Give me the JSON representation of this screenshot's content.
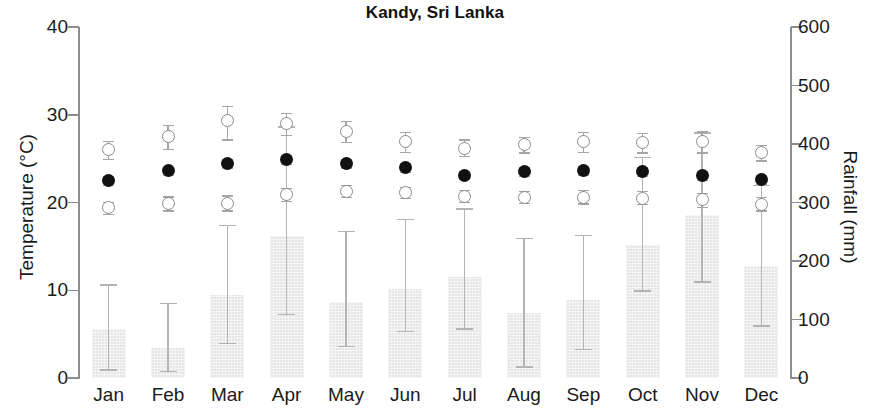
{
  "chart_data": {
    "type": "bar",
    "title": "Kandy, Sri Lanka",
    "xlabel": "",
    "ylabel": "Temperature (°C)",
    "y2label": "Rainfall (mm)",
    "categories": [
      "Jan",
      "Feb",
      "Mar",
      "Apr",
      "May",
      "Jun",
      "Jul",
      "Aug",
      "Sep",
      "Oct",
      "Nov",
      "Dec"
    ],
    "ylim": [
      0,
      40
    ],
    "yticks": [
      0,
      10,
      20,
      30,
      40
    ],
    "y2lim": [
      0,
      600
    ],
    "y2ticks": [
      0,
      100,
      200,
      300,
      400,
      500,
      600
    ],
    "grid": false,
    "legend": "none",
    "series": [
      {
        "name": "Rainfall",
        "axis": "right",
        "render": "bar",
        "unit": "mm",
        "values": [
          83,
          51,
          142,
          242,
          130,
          152,
          173,
          111,
          133,
          228,
          278,
          191
        ],
        "err_low": [
          15,
          12,
          60,
          110,
          55,
          80,
          85,
          20,
          50,
          150,
          165,
          90
        ],
        "err_high": [
          160,
          128,
          262,
          430,
          252,
          272,
          290,
          240,
          245,
          378,
          420,
          330
        ]
      },
      {
        "name": "Mean monthly maximum temperature",
        "axis": "left",
        "render": "open-circle",
        "unit": "°C",
        "values": [
          26.0,
          27.5,
          29.4,
          29.0,
          28.1,
          26.9,
          26.2,
          26.6,
          26.9,
          26.8,
          26.9,
          25.7
        ],
        "err_low": [
          25.0,
          26.1,
          27.2,
          27.7,
          26.9,
          25.8,
          25.3,
          25.7,
          25.8,
          25.7,
          25.7,
          24.8
        ],
        "err_high": [
          27.0,
          28.8,
          31.0,
          30.2,
          29.3,
          28.0,
          27.2,
          27.5,
          28.0,
          27.9,
          28.1,
          26.6
        ]
      },
      {
        "name": "Mean monthly temperature",
        "axis": "left",
        "render": "filled-circle",
        "unit": "°C",
        "values": [
          22.5,
          23.6,
          24.5,
          24.9,
          24.5,
          24.0,
          23.1,
          23.5,
          23.7,
          23.5,
          23.1,
          22.6
        ],
        "err_low": [
          22.0,
          23.1,
          24.0,
          24.4,
          24.0,
          23.5,
          22.7,
          23.0,
          23.2,
          23.0,
          22.6,
          22.1
        ],
        "err_high": [
          23.0,
          24.1,
          25.0,
          25.4,
          25.0,
          24.5,
          23.6,
          24.0,
          24.2,
          24.0,
          23.6,
          23.1
        ]
      },
      {
        "name": "Mean monthly minimum temperature",
        "axis": "left",
        "render": "open-circle",
        "unit": "°C",
        "values": [
          19.4,
          19.9,
          19.9,
          20.9,
          21.3,
          21.1,
          20.7,
          20.6,
          20.6,
          20.5,
          20.3,
          19.8
        ],
        "err_low": [
          18.7,
          19.1,
          19.1,
          20.2,
          20.6,
          20.5,
          20.1,
          20.0,
          19.9,
          19.8,
          19.5,
          19.1
        ],
        "err_high": [
          20.1,
          20.7,
          20.8,
          21.7,
          22.0,
          21.8,
          21.4,
          21.3,
          21.4,
          21.3,
          21.1,
          20.6
        ]
      }
    ]
  }
}
